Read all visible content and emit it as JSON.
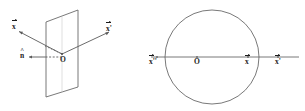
{
  "figure": {
    "background_color": "#ffffff",
    "stroke_color": "#555555",
    "text_color": "#1a1a1a",
    "panels": [
      {
        "id": "left-panel",
        "name": "mirror-plane-reflection-diagram",
        "description": "Vector reflection through a plane with unit normal",
        "elements": {
          "plane": {
            "name": "mirror-plane",
            "shape": "parallelogram",
            "points": "46,22 78,10 78,87 46,97"
          },
          "incident_ray": {
            "name": "incident-vector-x",
            "from": [
              18,
              31
            ],
            "to": [
              62,
              54
            ]
          },
          "reflected_ray": {
            "name": "reflected-vector-x-prime",
            "from": [
              62,
              54
            ],
            "to": [
              110,
              32
            ]
          },
          "normal_ray": {
            "name": "normal-vector-n-hat",
            "from": [
              29,
              57
            ],
            "to": [
              62,
              57
            ],
            "style": "dashed"
          },
          "dotted_connector": {
            "name": "dotted-projection-line",
            "from": [
              46,
              47
            ],
            "to": [
              62,
              54
            ],
            "style": "dotted"
          },
          "origin_point": {
            "name": "origin-point-O",
            "at": [
              62,
              54
            ]
          }
        },
        "labels": [
          {
            "id": "x-incident",
            "name": "label-x-incident",
            "text": "x",
            "accent": "vector",
            "prime": "",
            "x": 13,
            "y": 24
          },
          {
            "id": "x-prime",
            "name": "label-x-prime-reflected",
            "text": "x",
            "accent": "vector",
            "prime": "'",
            "x": 106,
            "y": 26
          },
          {
            "id": "n-hat",
            "name": "label-n-hat-normal",
            "text": "n",
            "accent": "hat",
            "prime": "",
            "x": 21,
            "y": 53
          },
          {
            "id": "origin-left",
            "name": "label-origin-O-left",
            "text": "O",
            "accent": "none",
            "prime": "",
            "x": 62,
            "y": 56
          }
        ]
      },
      {
        "id": "right-panel",
        "name": "unit-circle-reflection-diagram",
        "description": "Circle with horizontal axis through origin showing x, x-prime and x-double-prime",
        "elements": {
          "circle": {
            "name": "unit-circle",
            "center": [
              212,
              57
            ],
            "radius": 47
          },
          "axis_line": {
            "name": "horizontal-axis-line",
            "from": [
              152,
              57
            ],
            "to": [
              300,
              57
            ]
          },
          "points": [
            {
              "name": "point-O",
              "at": [
                197,
                57
              ]
            },
            {
              "name": "point-x",
              "at": [
                248,
                57
              ]
            },
            {
              "name": "point-x-prime",
              "at": [
                278,
                57
              ]
            },
            {
              "name": "point-x-dprime",
              "at": [
                157,
                57
              ]
            }
          ]
        },
        "labels": [
          {
            "id": "x-dprime-r",
            "name": "label-x-double-prime",
            "text": "x",
            "accent": "vector",
            "prime": "''",
            "x": 150,
            "y": 58
          },
          {
            "id": "origin-r",
            "name": "label-origin-O-right",
            "text": "O",
            "accent": "none",
            "prime": "",
            "x": 194,
            "y": 58
          },
          {
            "id": "x-r",
            "name": "label-x-right",
            "text": "x",
            "accent": "vector",
            "prime": "",
            "x": 245,
            "y": 58
          },
          {
            "id": "x-prime-r",
            "name": "label-x-prime-right",
            "text": "x",
            "accent": "vector",
            "prime": "'",
            "x": 275,
            "y": 58
          }
        ]
      }
    ]
  }
}
